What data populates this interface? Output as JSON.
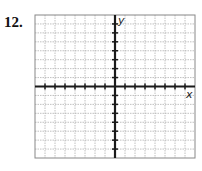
{
  "problem": {
    "number": "12."
  },
  "graph": {
    "x_label": "x",
    "y_label": "y",
    "grid": {
      "columns": 16,
      "rows": 16,
      "left": 35,
      "top": 15,
      "right": 195,
      "bottom": 158
    },
    "x_axis_row": 8,
    "y_axis_col": 8,
    "ticks_per_side": 7,
    "colors": {
      "grid": "#b0b0b0",
      "axis": "#1a1a1a",
      "border": "#888888"
    }
  }
}
